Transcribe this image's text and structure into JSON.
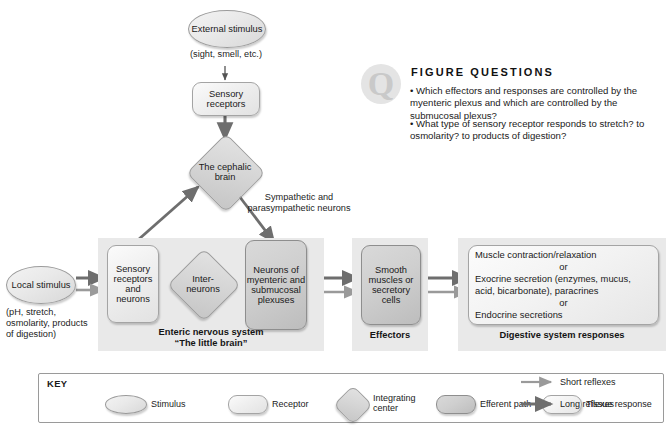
{
  "figure_questions": {
    "icon": "question-mark-circle-icon",
    "heading": "FIGURE QUESTIONS",
    "items": [
      "• Which effectors and responses are controlled by the myenteric plexus and which are controlled by the submucosal plexus?",
      "• What type of sensory receptor responds to stretch? to osmolarity? to products of digestion?"
    ]
  },
  "nodes": {
    "external_stimulus": "External stimulus",
    "external_stimulus_detail": "(sight, smell, etc.)",
    "sensory_receptors": "Sensory receptors",
    "cephalic_brain": "The cephalic brain",
    "sympathetic_label": "Sympathetic and parasympathetic neurons",
    "local_stimulus": "Local stimulus",
    "local_stimulus_detail": "(pH, stretch, osmolarity, products of digestion)",
    "sensory_receptors_and_neurons": "Sensory receptors and neurons",
    "interneurons": "Inter- neurons",
    "myenteric_submucosal": "Neurons of myenteric and submucosal plexuses",
    "smooth_muscles": "Smooth muscles or secretory cells",
    "digestive_responses": "Muscle contraction/relaxation or Exocrine secretion (enzymes, mucus, acid, bicarbonate), paracrines or Endocrine secretions"
  },
  "digestive_responses_lines": [
    "Muscle contraction/relaxation",
    "or",
    "Exocrine secretion (enzymes, mucus,",
    "acid, bicarbonate), paracrines",
    "or",
    "Endocrine secretions"
  ],
  "panels": {
    "enteric": {
      "line1": "Enteric nervous system",
      "line2": "“The little brain”"
    },
    "effectors": {
      "line1": "Effectors"
    },
    "responses": {
      "line1": "Digestive system responses"
    }
  },
  "key": {
    "title": "KEY",
    "items": [
      {
        "shape": "oval",
        "label": "Stimulus"
      },
      {
        "shape": "rounded",
        "label": "Receptor"
      },
      {
        "shape": "diamond",
        "label": "Integrating center"
      },
      {
        "shape": "rounded-dark",
        "label": "Efferent path"
      },
      {
        "shape": "rounded",
        "label": "Tissue response"
      }
    ],
    "arrows": [
      {
        "type": "thin",
        "label": "Short reflexes"
      },
      {
        "type": "thick",
        "label": "Long reflexes"
      }
    ]
  },
  "colors": {
    "panel_bg": "#e9e9e9",
    "shape_light": "#f0f0f0",
    "shape_dark": "#cfcfcf",
    "arrow_dark": "#6e6e6e",
    "arrow_light": "#9a9a9a",
    "text": "#1a1a1a",
    "page_bg": "#ffffff"
  }
}
